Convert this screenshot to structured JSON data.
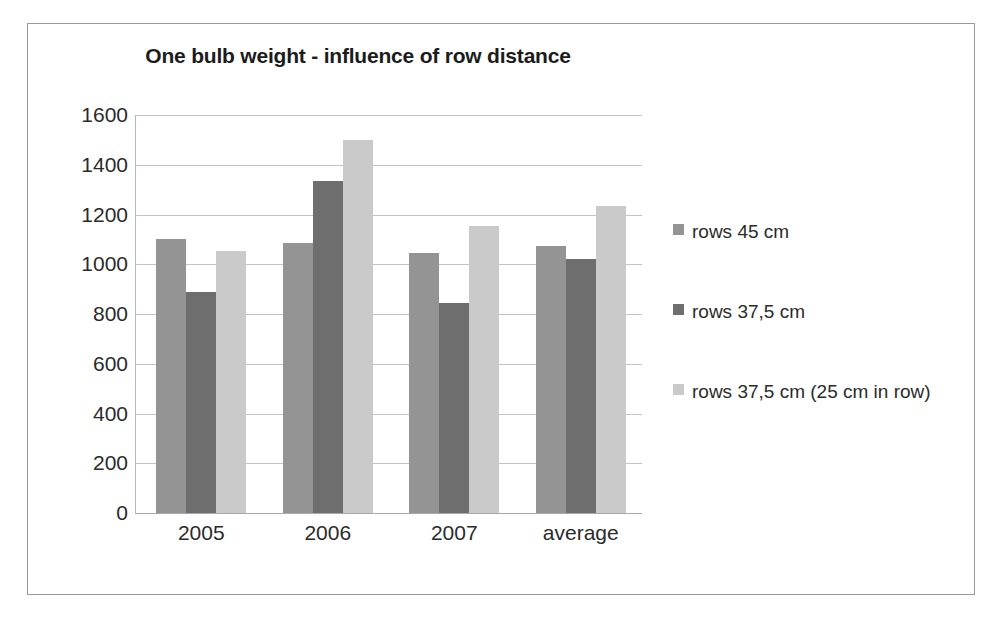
{
  "chart_data": {
    "type": "bar",
    "title": "One bulb weight - influence of row distance",
    "xlabel": "",
    "ylabel": "",
    "categories": [
      "2005",
      "2006",
      "2007",
      "average"
    ],
    "series": [
      {
        "name": "rows 45 cm",
        "color": "#949494",
        "values": [
          1100,
          1085,
          1045,
          1075
        ]
      },
      {
        "name": "rows 37,5 cm",
        "color": "#6e6e6e",
        "values": [
          890,
          1335,
          845,
          1020
        ]
      },
      {
        "name": "rows 37,5 cm (25 cm in row)",
        "color": "#cacaca",
        "values": [
          1055,
          1500,
          1155,
          1235
        ]
      }
    ],
    "ylim": [
      0,
      1600
    ],
    "ytick_step": 200,
    "yticks": [
      "1600",
      "1400",
      "1200",
      "1000",
      "800",
      "600",
      "400",
      "200",
      "0"
    ],
    "grid": true,
    "legend_position": "right"
  },
  "colors": {
    "frame": "#9a9a9a",
    "gridline": "#c4c4c4",
    "axis": "#a8a8a8",
    "text": "#2b2b2b",
    "title": "#1c1c1c"
  }
}
